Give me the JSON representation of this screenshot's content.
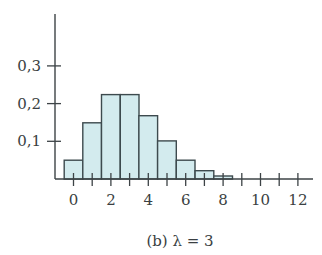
{
  "chart_data": {
    "type": "bar",
    "title": "",
    "caption": "(b) λ = 3",
    "xlabel": "",
    "ylabel": "",
    "categories": [
      0,
      1,
      2,
      3,
      4,
      5,
      6,
      7,
      8,
      9,
      10,
      11,
      12
    ],
    "values": [
      0.05,
      0.149,
      0.224,
      0.224,
      0.168,
      0.101,
      0.05,
      0.022,
      0.008,
      0.003,
      0.001,
      0.0,
      0.0
    ],
    "x_tick_labels": [
      "0",
      "2",
      "4",
      "6",
      "8",
      "10",
      "12"
    ],
    "x_tick_label_positions": [
      0,
      2,
      4,
      6,
      8,
      10,
      12
    ],
    "x_ticks_minor": [
      0,
      1,
      2,
      3,
      4,
      5,
      6,
      7,
      8,
      9,
      10,
      11,
      12
    ],
    "y_ticks": [
      0.1,
      0.2,
      0.3
    ],
    "y_tick_labels": [
      "0,1",
      "0,2",
      "0,3"
    ],
    "xlim": [
      -0.5,
      12.8
    ],
    "ylim": [
      0,
      0.44
    ],
    "grid": false,
    "legend": null,
    "bar_width": 1.0,
    "distribution": "Poisson, λ = 3",
    "colors": {
      "bar_fill": "#d3ebee",
      "bar_stroke": "#3d4a4e",
      "axis": "#3d4346",
      "text": "#3a3f42"
    }
  }
}
